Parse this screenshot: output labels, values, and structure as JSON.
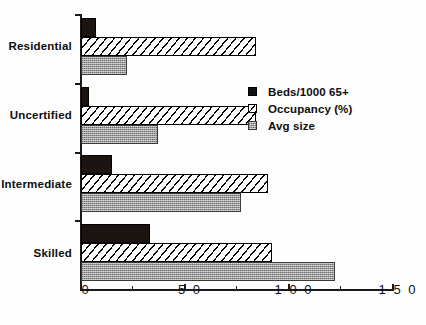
{
  "chart_data": {
    "type": "bar",
    "orientation": "horizontal",
    "title": "",
    "subtitle": "",
    "xlabel": "",
    "ylabel": "",
    "xlim": [
      0,
      150
    ],
    "ylim": null,
    "grid": false,
    "legend_position": "upper-right-inside",
    "categories": [
      "Residential",
      "Uncertified",
      "Intermediate",
      "Skilled"
    ],
    "xticks": [
      0,
      50,
      100,
      150
    ],
    "xtick_labels": [
      "0",
      "5 0",
      "1 0 0",
      "1 5 0"
    ],
    "xticks_minor": [
      25,
      75,
      125
    ],
    "series": [
      {
        "name": "Beds/1000 65+",
        "fill": "black",
        "color": "#1c1410",
        "values": [
          7,
          4,
          15,
          33
        ]
      },
      {
        "name": "Occupancy (%)",
        "fill": "diagonal-hatch",
        "color": "#ffffff",
        "values": [
          84,
          84,
          90,
          92
        ]
      },
      {
        "name": "Avg size",
        "fill": "gray-dither",
        "color": "#9d9d9d",
        "values": [
          22,
          37,
          77,
          122
        ]
      }
    ]
  },
  "legend": {
    "items": [
      {
        "label": "Beds/1000 65+",
        "swatch": "black-square-icon"
      },
      {
        "label": "Occupancy (%)",
        "swatch": "hatched-square-icon"
      },
      {
        "label": "Avg size",
        "swatch": "gray-square-icon"
      }
    ]
  },
  "axis": {
    "x_tick_labels": [
      "0",
      "5 0",
      "1 0 0",
      "1 5 0"
    ],
    "y_category_labels": [
      "Residential",
      "Uncertified",
      "Intermediate",
      "Skilled"
    ]
  }
}
